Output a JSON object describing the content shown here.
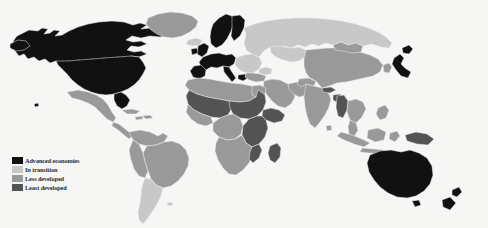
{
  "figure": {
    "type": "choropleth-world-map",
    "projection": "equirectangular",
    "background_color": "#f7f7f6",
    "width": 488,
    "height": 228
  },
  "legend": {
    "name": "map-legend",
    "position": "bottom-left",
    "items": [
      {
        "label": "Advanced economies",
        "color": "#111111",
        "key": "advanced"
      },
      {
        "label": "In transition",
        "color": "#c9c9c9",
        "key": "transition"
      },
      {
        "label": "Less developed",
        "color": "#9a9a9a",
        "key": "less-developed"
      },
      {
        "label": "Least developed",
        "color": "#545454",
        "key": "least-developed"
      }
    ]
  },
  "palette": {
    "advanced": "#111111",
    "transition": "#c9c9c9",
    "less_developed": "#9a9a9a",
    "least_developed": "#545454",
    "ocean": "#f7f7f6",
    "border": "#efefef"
  },
  "regions": [
    {
      "name": "United States",
      "category": "advanced"
    },
    {
      "name": "Canada",
      "category": "advanced"
    },
    {
      "name": "Western Europe",
      "category": "advanced"
    },
    {
      "name": "Scandinavia",
      "category": "advanced"
    },
    {
      "name": "United Kingdom",
      "category": "advanced"
    },
    {
      "name": "Japan",
      "category": "advanced"
    },
    {
      "name": "Australia",
      "category": "advanced"
    },
    {
      "name": "New Zealand",
      "category": "advanced"
    },
    {
      "name": "Greenland",
      "category": "less_developed"
    },
    {
      "name": "Mexico",
      "category": "less_developed"
    },
    {
      "name": "Central America",
      "category": "less_developed"
    },
    {
      "name": "Brazil",
      "category": "less_developed"
    },
    {
      "name": "Andean States",
      "category": "less_developed"
    },
    {
      "name": "Argentina",
      "category": "transition"
    },
    {
      "name": "Chile",
      "category": "transition"
    },
    {
      "name": "Russia",
      "category": "transition"
    },
    {
      "name": "Eastern Europe",
      "category": "transition"
    },
    {
      "name": "Central Asia",
      "category": "transition"
    },
    {
      "name": "North Africa",
      "category": "less_developed"
    },
    {
      "name": "Sahel",
      "category": "least_developed"
    },
    {
      "name": "Horn of Africa",
      "category": "least_developed"
    },
    {
      "name": "East Africa",
      "category": "least_developed"
    },
    {
      "name": "Southern Africa",
      "category": "less_developed"
    },
    {
      "name": "Middle East",
      "category": "less_developed"
    },
    {
      "name": "India",
      "category": "less_developed"
    },
    {
      "name": "China",
      "category": "less_developed"
    },
    {
      "name": "Southeast Asia",
      "category": "less_developed"
    },
    {
      "name": "Myanmar",
      "category": "least_developed"
    },
    {
      "name": "Nepal",
      "category": "least_developed"
    },
    {
      "name": "Bangladesh",
      "category": "least_developed"
    },
    {
      "name": "Indonesia",
      "category": "less_developed"
    },
    {
      "name": "Papua New Guinea",
      "category": "least_developed"
    },
    {
      "name": "Madagascar",
      "category": "least_developed"
    }
  ]
}
